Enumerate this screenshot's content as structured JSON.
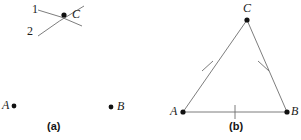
{
  "figure": {
    "background_color": "#ffffff",
    "stroke_color": "#6e6e6e",
    "point_color": "#111111",
    "text_color": "#1b1b1b",
    "width": 301,
    "height": 140
  },
  "panel_a": {
    "caption": "(a)",
    "caption_x": 47,
    "caption_y": 121,
    "arc_labels": [
      {
        "text": "1",
        "x": 32,
        "y": 3
      },
      {
        "text": "2",
        "x": 27,
        "y": 25
      }
    ],
    "points": [
      {
        "name": "C",
        "label": "C",
        "dot_x": 64,
        "dot_y": 15,
        "label_x": 72,
        "label_y": 8
      },
      {
        "name": "A",
        "label": "A",
        "dot_x": 14,
        "dot_y": 106,
        "label_x": 2,
        "label_y": 99
      },
      {
        "name": "B",
        "label": "B",
        "dot_x": 111,
        "dot_y": 107,
        "label_x": 117,
        "label_y": 100
      }
    ],
    "arcs": [
      {
        "id": "arc-1",
        "path": "M 38 10 Q 62 16 82 26"
      },
      {
        "id": "arc-2",
        "path": "M 38 36 Q 58 21 84 6"
      }
    ]
  },
  "panel_b": {
    "caption": "(b)",
    "caption_x": 229,
    "caption_y": 121,
    "vertices": [
      {
        "name": "C",
        "label": "C",
        "x": 247,
        "y": 20,
        "label_x": 243,
        "label_y": 2
      },
      {
        "name": "A",
        "label": "A",
        "x": 183,
        "y": 112,
        "label_x": 170,
        "label_y": 105
      },
      {
        "name": "B",
        "label": "B",
        "x": 287,
        "y": 112,
        "label_x": 291,
        "label_y": 105
      }
    ],
    "sides": [
      {
        "id": "side-AC",
        "from": "A",
        "to": "C",
        "tick_count": 1
      },
      {
        "id": "side-CB",
        "from": "C",
        "to": "B",
        "tick_count": 1
      },
      {
        "id": "side-AB",
        "from": "A",
        "to": "B",
        "tick_count": 1
      }
    ],
    "tick_marks": [
      {
        "id": "tick-side-AC",
        "x1": 202,
        "y1": 71,
        "x2": 213,
        "y2": 61
      },
      {
        "id": "tick-side-CB",
        "x1": 258,
        "y1": 61,
        "x2": 269,
        "y2": 71
      },
      {
        "id": "tick-side-AB",
        "x1": 235,
        "y1": 105,
        "x2": 235,
        "y2": 119
      }
    ]
  }
}
